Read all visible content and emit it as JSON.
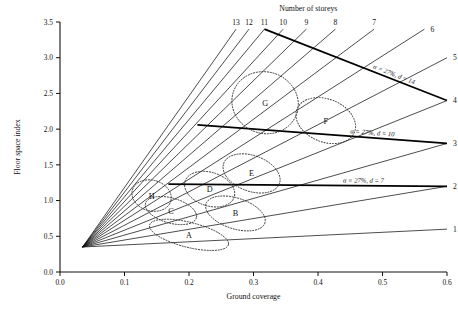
{
  "chart_data": {
    "type": "line",
    "title": "",
    "xlabel": "Ground coverage",
    "ylabel": "Floor space index",
    "xlim": [
      0.0,
      0.6
    ],
    "ylim": [
      0.0,
      3.5
    ],
    "xticks": [
      "0.0",
      "0.1",
      "0.2",
      "0.3",
      "0.4",
      "0.5",
      "0.6"
    ],
    "xtick_values": [
      0.0,
      0.1,
      0.2,
      0.3,
      0.4,
      0.5,
      0.6
    ],
    "yticks": [
      "0.0",
      "0.5",
      "1.0",
      "1.5",
      "2.0",
      "2.5",
      "3.0",
      "3.5"
    ],
    "ytick_values": [
      0.0,
      0.5,
      1.0,
      1.5,
      2.0,
      2.5,
      3.0,
      3.5
    ],
    "grid": false,
    "legend": "none",
    "fan_header": "Number of storeys",
    "fan_origin": {
      "x": 0.035,
      "y": 0.35
    },
    "rays": [
      {
        "label": "1",
        "storeys": 1,
        "end_x": 0.6,
        "end_y": 0.6,
        "label_pos": "right"
      },
      {
        "label": "2",
        "storeys": 2,
        "end_x": 0.6,
        "end_y": 1.2,
        "label_pos": "right"
      },
      {
        "label": "3",
        "storeys": 3,
        "end_x": 0.6,
        "end_y": 1.8,
        "label_pos": "right"
      },
      {
        "label": "4",
        "storeys": 4,
        "end_x": 0.6,
        "end_y": 2.4,
        "label_pos": "right"
      },
      {
        "label": "5",
        "storeys": 5,
        "end_x": 0.6,
        "end_y": 3.0,
        "label_pos": "right"
      },
      {
        "label": "6",
        "storeys": 6,
        "end_x": 0.565,
        "end_y": 3.4,
        "label_pos": "right"
      },
      {
        "label": "7",
        "storeys": 7,
        "end_x": 0.487,
        "end_y": 3.4,
        "label_pos": "top"
      },
      {
        "label": "8",
        "storeys": 8,
        "end_x": 0.427,
        "end_y": 3.4,
        "label_pos": "top"
      },
      {
        "label": "9",
        "storeys": 9,
        "end_x": 0.382,
        "end_y": 3.4,
        "label_pos": "top"
      },
      {
        "label": "10",
        "storeys": 10,
        "end_x": 0.346,
        "end_y": 3.4,
        "label_pos": "top"
      },
      {
        "label": "11",
        "storeys": 11,
        "end_x": 0.317,
        "end_y": 3.4,
        "label_pos": "top"
      },
      {
        "label": "12",
        "storeys": 12,
        "end_x": 0.293,
        "end_y": 3.4,
        "label_pos": "top"
      },
      {
        "label": "13",
        "storeys": 13,
        "end_x": 0.273,
        "end_y": 3.4,
        "label_pos": "top"
      }
    ],
    "depth_lines": [
      {
        "label": "α = 27%, d = 14",
        "d": 14,
        "alpha": "27%",
        "x1": 0.317,
        "y1": 3.4,
        "x2": 0.6,
        "y2": 2.4
      },
      {
        "label": "α = 27%, d = 10",
        "d": 10,
        "alpha": "27%",
        "x1": 0.213,
        "y1": 2.06,
        "x2": 0.6,
        "y2": 1.8
      },
      {
        "label": "α = 27%, d = 7",
        "d": 7,
        "alpha": "27%",
        "x1": 0.168,
        "y1": 1.23,
        "x2": 0.6,
        "y2": 1.2
      }
    ],
    "clusters": [
      {
        "label": "A",
        "cx": 0.2,
        "cy": 0.52,
        "rx": 0.063,
        "ry": 0.175,
        "rot": 14
      },
      {
        "label": "B",
        "cx": 0.272,
        "cy": 0.82,
        "rx": 0.048,
        "ry": 0.215,
        "rot": 18
      },
      {
        "label": "C",
        "cx": 0.172,
        "cy": 0.86,
        "rx": 0.041,
        "ry": 0.175,
        "rot": 16
      },
      {
        "label": "D",
        "cx": 0.232,
        "cy": 1.16,
        "rx": 0.04,
        "ry": 0.235,
        "rot": 18
      },
      {
        "label": "E",
        "cx": 0.297,
        "cy": 1.38,
        "rx": 0.046,
        "ry": 0.25,
        "rot": 20
      },
      {
        "label": "F",
        "cx": 0.412,
        "cy": 2.12,
        "rx": 0.048,
        "ry": 0.3,
        "rot": 22
      },
      {
        "label": "G",
        "cx": 0.318,
        "cy": 2.37,
        "rx": 0.052,
        "ry": 0.43,
        "rot": 20
      },
      {
        "label": "H",
        "cx": 0.142,
        "cy": 1.07,
        "rx": 0.031,
        "ry": 0.215,
        "rot": 16
      }
    ]
  }
}
